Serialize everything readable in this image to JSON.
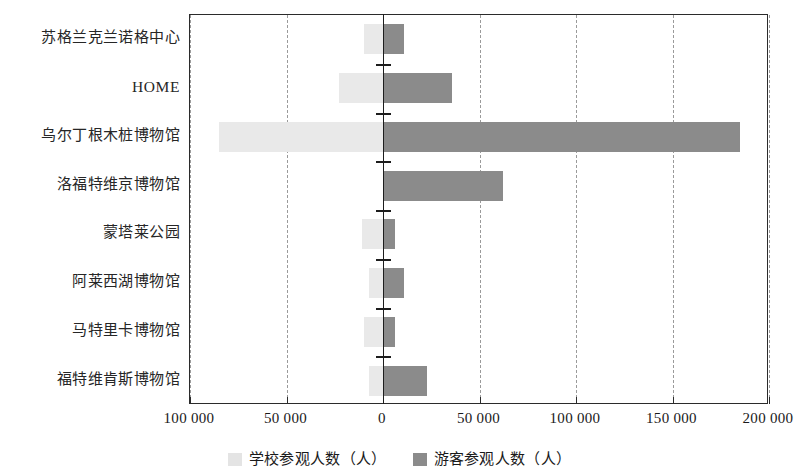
{
  "chart_data": {
    "type": "bar",
    "orientation": "horizontal",
    "title": "",
    "xlabel": "",
    "ylabel": "",
    "xlim": [
      -100000,
      200000
    ],
    "xticks": [
      -100000,
      -50000,
      0,
      50000,
      100000,
      150000,
      200000
    ],
    "xtick_labels": [
      "100 000",
      "50 000",
      "0",
      "50 000",
      "100 000",
      "150 000",
      "200 000"
    ],
    "grid": true,
    "grid_style": "dashed-vertical",
    "legend_position": "bottom-center",
    "categories": [
      "苏格兰克兰诺格中心",
      "HOME",
      "乌尔丁根木桩博物馆",
      "洛福特维京博物馆",
      "蒙塔莱公园",
      "阿莱西湖博物馆",
      "马特里卡博物馆",
      "福特维肯斯博物馆"
    ],
    "series": [
      {
        "name": "学校参观人数（人）",
        "color": "#e9e9e9",
        "direction": "left",
        "values": [
          10000,
          23000,
          85000,
          0,
          11000,
          7000,
          10000,
          7000
        ]
      },
      {
        "name": "游客参观人数（人）",
        "color": "#8b8b8b",
        "direction": "right",
        "values": [
          11000,
          36000,
          185000,
          62000,
          6000,
          11000,
          6000,
          23000
        ]
      }
    ]
  },
  "legend": {
    "items": [
      {
        "label": "学校参观人数（人）",
        "swatch": "school"
      },
      {
        "label": "游客参观人数（人）",
        "swatch": "tourist"
      }
    ]
  },
  "colors": {
    "school_bar": "#e9e9e9",
    "tourist_bar": "#8b8b8b",
    "axis": "#1d1d1d",
    "gridline": "#9a9a9a",
    "text": "#1a1a1a",
    "background": "#ffffff"
  }
}
